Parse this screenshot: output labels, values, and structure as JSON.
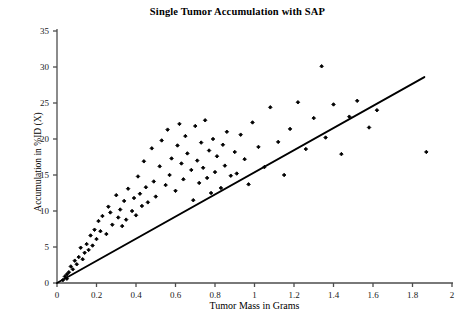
{
  "chart_data": {
    "type": "scatter",
    "title": "Single Tumor Accumulation with SAP",
    "xlabel": "Tumor Mass in Grams",
    "ylabel": "Accumulation in %ID (X)",
    "xlim": [
      0,
      2
    ],
    "ylim": [
      0,
      35
    ],
    "xticks": [
      0,
      0.2,
      0.4,
      0.6,
      0.8,
      1,
      1.2,
      1.4,
      1.6,
      1.8,
      2
    ],
    "xticklabels": [
      "0",
      "0.2",
      "0.4",
      "0.6",
      "0.8",
      "1",
      "1.2",
      "1.4",
      "1.6",
      "1.8",
      "2"
    ],
    "yticks": [
      0,
      5,
      10,
      15,
      20,
      25,
      30,
      35
    ],
    "yticklabels": [
      "0",
      "5",
      "10",
      "15",
      "20",
      "25",
      "30",
      "35"
    ],
    "grid": false,
    "legend": null,
    "marker": "filled-diamond",
    "marker_color": "#000000",
    "series": [
      {
        "name": "Single Tumor Accumulation",
        "points": [
          [
            0.03,
            0.4
          ],
          [
            0.04,
            0.9
          ],
          [
            0.05,
            1.2
          ],
          [
            0.05,
            0.6
          ],
          [
            0.06,
            1.5
          ],
          [
            0.07,
            2.3
          ],
          [
            0.08,
            1.9
          ],
          [
            0.09,
            3.1
          ],
          [
            0.1,
            2.6
          ],
          [
            0.11,
            3.6
          ],
          [
            0.12,
            4.9
          ],
          [
            0.13,
            3.3
          ],
          [
            0.14,
            4.2
          ],
          [
            0.15,
            5.4
          ],
          [
            0.16,
            4.6
          ],
          [
            0.17,
            6.6
          ],
          [
            0.18,
            5.2
          ],
          [
            0.19,
            7.4
          ],
          [
            0.2,
            6.1
          ],
          [
            0.21,
            8.6
          ],
          [
            0.22,
            7.2
          ],
          [
            0.23,
            9.3
          ],
          [
            0.25,
            6.8
          ],
          [
            0.26,
            10.6
          ],
          [
            0.27,
            9.8
          ],
          [
            0.28,
            8.1
          ],
          [
            0.3,
            12.2
          ],
          [
            0.31,
            9.1
          ],
          [
            0.32,
            10.2
          ],
          [
            0.33,
            7.9
          ],
          [
            0.34,
            11.4
          ],
          [
            0.35,
            8.8
          ],
          [
            0.36,
            13.1
          ],
          [
            0.38,
            10.0
          ],
          [
            0.39,
            11.8
          ],
          [
            0.4,
            9.4
          ],
          [
            0.41,
            14.8
          ],
          [
            0.42,
            12.4
          ],
          [
            0.43,
            10.7
          ],
          [
            0.44,
            16.9
          ],
          [
            0.45,
            13.3
          ],
          [
            0.46,
            11.2
          ],
          [
            0.48,
            18.7
          ],
          [
            0.49,
            14.1
          ],
          [
            0.5,
            12.0
          ],
          [
            0.52,
            16.2
          ],
          [
            0.53,
            19.8
          ],
          [
            0.55,
            13.6
          ],
          [
            0.56,
            21.3
          ],
          [
            0.57,
            15.0
          ],
          [
            0.58,
            17.3
          ],
          [
            0.6,
            12.8
          ],
          [
            0.61,
            19.1
          ],
          [
            0.62,
            22.1
          ],
          [
            0.63,
            16.6
          ],
          [
            0.64,
            14.4
          ],
          [
            0.65,
            20.4
          ],
          [
            0.66,
            18.0
          ],
          [
            0.68,
            15.7
          ],
          [
            0.69,
            11.5
          ],
          [
            0.7,
            21.8
          ],
          [
            0.71,
            17.0
          ],
          [
            0.72,
            13.9
          ],
          [
            0.73,
            19.5
          ],
          [
            0.74,
            16.0
          ],
          [
            0.75,
            22.6
          ],
          [
            0.76,
            14.6
          ],
          [
            0.77,
            18.4
          ],
          [
            0.78,
            12.5
          ],
          [
            0.79,
            20.0
          ],
          [
            0.8,
            15.4
          ],
          [
            0.81,
            17.6
          ],
          [
            0.83,
            13.2
          ],
          [
            0.84,
            19.2
          ],
          [
            0.85,
            16.3
          ],
          [
            0.86,
            21.0
          ],
          [
            0.88,
            14.9
          ],
          [
            0.9,
            18.2
          ],
          [
            0.91,
            15.2
          ],
          [
            0.93,
            20.6
          ],
          [
            0.95,
            17.2
          ],
          [
            0.97,
            13.7
          ],
          [
            0.99,
            22.3
          ],
          [
            1.02,
            18.9
          ],
          [
            1.05,
            16.1
          ],
          [
            1.08,
            24.4
          ],
          [
            1.12,
            19.6
          ],
          [
            1.15,
            15.0
          ],
          [
            1.18,
            21.4
          ],
          [
            1.22,
            25.1
          ],
          [
            1.26,
            18.6
          ],
          [
            1.3,
            22.9
          ],
          [
            1.34,
            30.1
          ],
          [
            1.36,
            20.2
          ],
          [
            1.4,
            24.8
          ],
          [
            1.44,
            17.9
          ],
          [
            1.48,
            23.1
          ],
          [
            1.52,
            25.3
          ],
          [
            1.58,
            21.6
          ],
          [
            1.62,
            24.0
          ],
          [
            1.87,
            18.2
          ]
        ]
      }
    ],
    "trendline": {
      "name": "linear fit",
      "from": [
        0,
        0
      ],
      "to": [
        1.86,
        28.6
      ],
      "color": "#000000"
    }
  }
}
